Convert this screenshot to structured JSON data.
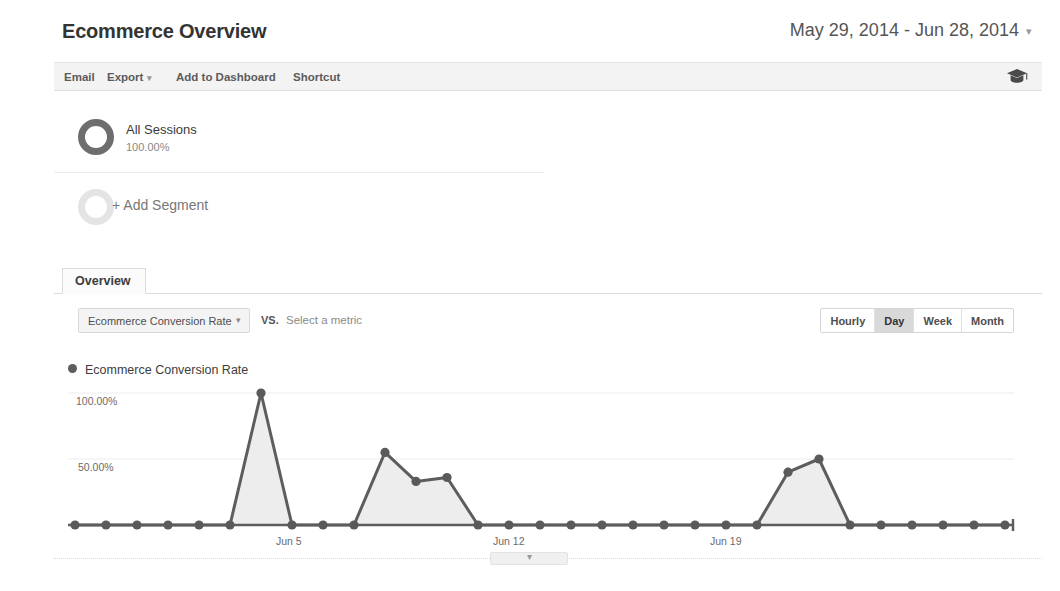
{
  "header": {
    "title": "Ecommerce Overview",
    "date_range": "May 29, 2014 - Jun 28, 2014",
    "date_range_caret": "▾"
  },
  "toolbar": {
    "email_label": "Email",
    "export_label": "Export",
    "export_caret": "▾",
    "add_to_dashboard_label": "Add to Dashboard",
    "shortcut_label": "Shortcut",
    "help_icon": "graduation-cap-icon"
  },
  "segments": [
    {
      "name": "All Sessions",
      "percent": "100.00%",
      "icon": "donut-ring-icon"
    },
    {
      "name": "+ Add Segment",
      "icon": "donut-ring-outline-icon"
    }
  ],
  "tabs": [
    {
      "label": "Overview",
      "active": true
    }
  ],
  "metric_controls": {
    "primary_metric": "Ecommerce Conversion Rate",
    "primary_metric_caret": "▾",
    "vs_label": "VS.",
    "secondary_metric_placeholder": "Select a metric",
    "granularity": [
      {
        "label": "Hourly",
        "active": false
      },
      {
        "label": "Day",
        "active": true
      },
      {
        "label": "Week",
        "active": false
      },
      {
        "label": "Month",
        "active": false
      }
    ]
  },
  "chart_expander": {
    "caret": "▾"
  },
  "colors": {
    "line": "#5d5d5d",
    "area_fill": "#ededed",
    "marker": "#5a5a5a",
    "grid": "#ececec",
    "axis": "#5d5d5d",
    "text": "#6b6b6b",
    "active_button_bg": "#d9d9d9"
  },
  "chart_data": {
    "type": "area",
    "title": "Ecommerce Conversion Rate",
    "xlabel": "",
    "ylabel": "",
    "ylim": [
      0,
      100
    ],
    "yticks": [
      50,
      100
    ],
    "ytick_labels": [
      "50.00%",
      "100.00%"
    ],
    "grid": true,
    "legend": [
      "Ecommerce Conversion Rate"
    ],
    "legend_position": "top-left",
    "x": [
      "May 29",
      "May 30",
      "May 31",
      "Jun 1",
      "Jun 2",
      "Jun 3",
      "Jun 4",
      "Jun 5",
      "Jun 6",
      "Jun 7",
      "Jun 8",
      "Jun 9",
      "Jun 10",
      "Jun 11",
      "Jun 12",
      "Jun 13",
      "Jun 14",
      "Jun 15",
      "Jun 16",
      "Jun 17",
      "Jun 18",
      "Jun 19",
      "Jun 20",
      "Jun 21",
      "Jun 22",
      "Jun 23",
      "Jun 24",
      "Jun 25",
      "Jun 26",
      "Jun 27",
      "Jun 28"
    ],
    "xtick_labels": [
      "Jun 5",
      "Jun 12",
      "Jun 19"
    ],
    "xtick_indices": [
      7,
      14,
      21
    ],
    "series": [
      {
        "name": "Ecommerce Conversion Rate",
        "values": [
          0,
          0,
          0,
          0,
          0,
          0,
          100,
          0,
          0,
          0,
          55,
          33,
          36,
          0,
          0,
          0,
          0,
          0,
          0,
          0,
          0,
          0,
          0,
          40,
          50,
          0,
          0,
          0,
          0,
          0,
          0
        ]
      }
    ]
  }
}
